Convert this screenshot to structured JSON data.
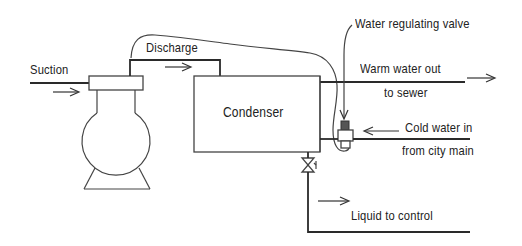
{
  "diagram": {
    "components": {
      "compressor": {
        "icon": "compressor-icon"
      },
      "condenser": {
        "label": "Condenser"
      },
      "water_regulating_valve": {
        "label": "Water regulating valve",
        "icon": "valve-icon"
      },
      "liquid_shutoff_valve": {
        "icon": "shutoff-valve-icon"
      }
    },
    "labels": {
      "suction": "Suction",
      "discharge": "Discharge",
      "condenser": "Condenser",
      "water_regulating_valve": "Water regulating valve",
      "warm_water_line1": "Warm water out",
      "warm_water_line2": "to sewer",
      "cold_water_line1": "Cold water in",
      "cold_water_line2": "from city main",
      "liquid_to_control": "Liquid to control"
    },
    "flows": [
      {
        "name": "Suction",
        "direction": "right"
      },
      {
        "name": "Discharge",
        "direction": "right"
      },
      {
        "name": "Warm water out to sewer",
        "direction": "right"
      },
      {
        "name": "Cold water in from city main",
        "direction": "left"
      },
      {
        "name": "Liquid to control",
        "direction": "right"
      }
    ],
    "colors": {
      "line": "#2a2a2a",
      "text": "#222222",
      "background": "#ffffff"
    }
  }
}
